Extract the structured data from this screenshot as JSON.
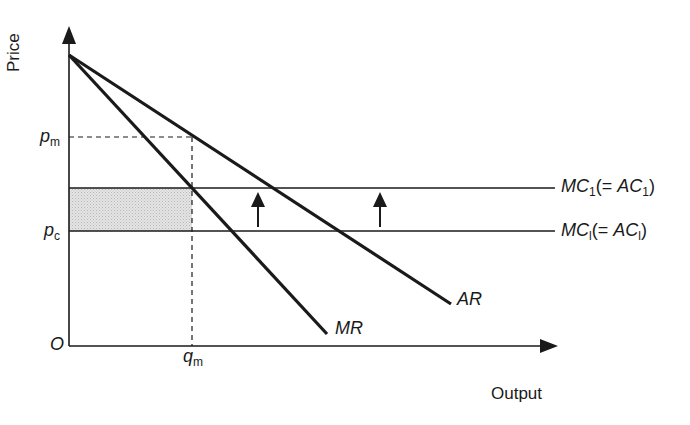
{
  "diagram": {
    "axes": {
      "y_label": "Price",
      "x_label": "Output",
      "origin_label": "O"
    },
    "price_ticks": {
      "pm": {
        "main": "p",
        "sub": "m"
      },
      "pc": {
        "main": "p",
        "sub": "c"
      }
    },
    "quantity_ticks": {
      "qm": {
        "main": "q",
        "sub": "m"
      }
    },
    "curves": {
      "mr_label": "MR",
      "ar_label": "AR",
      "mc1_label": {
        "main": "MC",
        "sub": "1",
        "paren_open": "(= ",
        "paren_main": "AC",
        "paren_sub": "1",
        "paren_close": ")"
      },
      "mc0_label": {
        "main": "MC",
        "sub": "l",
        "paren_open": "(= ",
        "paren_main": "AC",
        "paren_sub": "l",
        "paren_close": ")"
      }
    },
    "colors": {
      "line": "#1a1a1a",
      "shade": "#d9d9d9",
      "background": "#ffffff"
    }
  }
}
